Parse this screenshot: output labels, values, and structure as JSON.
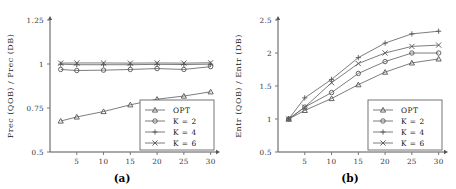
{
  "figure": {
    "panels": [
      {
        "id": "a",
        "caption": "(a)",
        "ylabel": "Prec (QOB) / Prec (DB)",
        "xlabel": ""
      },
      {
        "id": "b",
        "caption": "(b)",
        "ylabel": "Entr (QOB) / Entr (DB)",
        "xlabel": ""
      }
    ]
  },
  "chart_data": [
    {
      "type": "line",
      "panel": "(a)",
      "title": "",
      "xlabel": "",
      "ylabel": "Prec (QOB) / Prec (DB)",
      "x": [
        2,
        5,
        10,
        15,
        20,
        25,
        30
      ],
      "xticks": [
        5,
        10,
        15,
        20,
        25,
        30
      ],
      "xticklabels": [
        "5",
        "10",
        "15",
        "20",
        "25",
        "30"
      ],
      "yticks": [
        0.5,
        0.75,
        1,
        1.25
      ],
      "yticklabels": [
        "0.5",
        "0.75",
        "1",
        "1.25"
      ],
      "xlim": [
        0,
        31
      ],
      "ylim": [
        0.5,
        1.25
      ],
      "grid": false,
      "legend_position": "lower-right",
      "series": [
        {
          "name": "OPT",
          "marker": "triangle",
          "values": [
            0.676,
            0.699,
            0.73,
            0.768,
            0.8,
            0.818,
            0.842
          ]
        },
        {
          "name": "K = 2",
          "marker": "circle",
          "values": [
            0.969,
            0.963,
            0.965,
            0.969,
            0.974,
            0.969,
            0.985
          ]
        },
        {
          "name": "K = 4",
          "marker": "plus",
          "values": [
            0.999,
            0.996,
            0.996,
            0.996,
            0.998,
            0.997,
            0.999
          ]
        },
        {
          "name": "K = 6",
          "marker": "cross",
          "values": [
            1.005,
            1.006,
            1.006,
            1.005,
            1.006,
            1.005,
            1.007
          ]
        }
      ]
    },
    {
      "type": "line",
      "panel": "(b)",
      "title": "",
      "xlabel": "",
      "ylabel": "Entr (QOB) / Entr (DB)",
      "x": [
        2,
        5,
        10,
        15,
        20,
        25,
        30
      ],
      "xticks": [
        5,
        10,
        15,
        20,
        25,
        30
      ],
      "xticklabels": [
        "5",
        "10",
        "15",
        "20",
        "25",
        "30"
      ],
      "yticks": [
        0.5,
        1,
        1.5,
        2,
        2.5
      ],
      "yticklabels": [
        "0.5",
        "1",
        "1.5",
        "2",
        "2.5"
      ],
      "xlim": [
        0,
        31
      ],
      "ylim": [
        0.5,
        2.5
      ],
      "grid": false,
      "legend_position": "lower-right",
      "series": [
        {
          "name": "OPT",
          "marker": "triangle",
          "values": [
            1.0,
            1.13,
            1.31,
            1.52,
            1.71,
            1.85,
            1.91
          ]
        },
        {
          "name": "K = 2",
          "marker": "circle",
          "values": [
            1.0,
            1.18,
            1.4,
            1.69,
            1.87,
            2.0,
            2.0
          ]
        },
        {
          "name": "K = 4",
          "marker": "plus",
          "values": [
            1.0,
            1.32,
            1.6,
            1.93,
            2.15,
            2.29,
            2.33
          ]
        },
        {
          "name": "K = 6",
          "marker": "cross",
          "values": [
            1.0,
            1.18,
            1.55,
            1.84,
            2.0,
            2.1,
            2.12
          ]
        }
      ]
    }
  ]
}
